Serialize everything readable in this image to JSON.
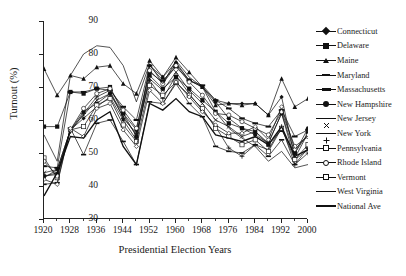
{
  "chart_data": {
    "type": "line",
    "title": "",
    "xlabel": "Presidential Election Years",
    "ylabel": "Turnout (%)",
    "xlim": [
      1920,
      2000
    ],
    "ylim": [
      30,
      90
    ],
    "yticks": [
      30,
      40,
      50,
      60,
      70,
      80,
      90
    ],
    "xticks": [
      1920,
      1928,
      1936,
      1944,
      1952,
      1960,
      1968,
      1976,
      1984,
      1992,
      2000
    ],
    "xtick_minor_step": 4,
    "grid": false,
    "legend_position": "right",
    "x": [
      1920,
      1924,
      1928,
      1932,
      1936,
      1940,
      1944,
      1948,
      1952,
      1956,
      1960,
      1964,
      1968,
      1972,
      1976,
      1980,
      1984,
      1988,
      1992,
      1996,
      2000
    ],
    "series": [
      {
        "name": "Connecticut",
        "marker": "diamond",
        "values": [
          42.5,
          45.0,
          57.0,
          60.5,
          64.0,
          67.0,
          60.0,
          54.0,
          76.5,
          73.0,
          77.5,
          72.0,
          70.0,
          66.0,
          65.0,
          65.0,
          65.0,
          61.5,
          67.0,
          48.5,
          56.0
        ]
      },
      {
        "name": "Delaware",
        "marker": "square",
        "values": [
          58.0,
          58.0,
          68.5,
          68.0,
          69.5,
          70.0,
          62.0,
          55.0,
          73.5,
          69.5,
          73.0,
          69.5,
          66.0,
          62.5,
          59.0,
          57.5,
          56.5,
          52.5,
          57.0,
          50.0,
          56.0
        ]
      },
      {
        "name": "Maine",
        "marker": "triangle",
        "values": [
          75.5,
          67.5,
          73.5,
          72.5,
          76.0,
          76.5,
          71.0,
          68.0,
          78.0,
          73.0,
          79.0,
          74.5,
          70.0,
          64.5,
          65.0,
          64.5,
          65.0,
          61.5,
          72.5,
          64.0,
          66.5
        ]
      },
      {
        "name": "Maryland",
        "marker": "dash",
        "values": [
          40.5,
          41.0,
          57.5,
          49.5,
          59.0,
          60.0,
          53.5,
          46.5,
          65.5,
          65.0,
          71.0,
          65.0,
          61.0,
          52.0,
          50.5,
          50.0,
          52.5,
          49.0,
          54.0,
          46.5,
          51.5
        ]
      },
      {
        "name": "Massachusetts",
        "marker": "bar",
        "values": [
          46.0,
          45.5,
          68.5,
          68.5,
          69.5,
          69.0,
          64.0,
          60.0,
          76.5,
          72.0,
          76.0,
          72.0,
          70.5,
          66.0,
          63.5,
          60.5,
          59.0,
          58.0,
          63.0,
          55.0,
          57.0
        ]
      },
      {
        "name": "New Hampshire",
        "marker": "circle",
        "values": [
          43.0,
          43.5,
          57.0,
          62.5,
          65.0,
          68.0,
          62.0,
          57.0,
          74.5,
          71.5,
          77.0,
          72.0,
          70.0,
          65.5,
          60.5,
          57.5,
          55.5,
          53.0,
          62.0,
          50.0,
          57.5
        ]
      },
      {
        "name": "New Jersey",
        "marker": "x",
        "values": [
          44.0,
          45.0,
          57.0,
          61.5,
          66.0,
          68.0,
          61.0,
          55.5,
          72.5,
          69.0,
          74.5,
          69.0,
          65.0,
          60.0,
          58.0,
          55.0,
          56.5,
          53.0,
          62.0,
          48.0,
          51.0
        ]
      },
      {
        "name": "New York",
        "marker": "plus",
        "values": [
          43.0,
          44.0,
          56.5,
          62.0,
          67.0,
          69.0,
          60.5,
          56.0,
          72.0,
          66.5,
          73.5,
          68.0,
          63.0,
          58.0,
          51.5,
          49.0,
          52.5,
          51.0,
          58.0,
          46.5,
          50.0
        ]
      },
      {
        "name": "Pennsylvania",
        "marker": "open-square",
        "values": [
          48.5,
          42.5,
          57.0,
          58.0,
          64.5,
          66.5,
          58.5,
          53.5,
          70.5,
          67.5,
          71.5,
          67.5,
          63.5,
          57.5,
          55.0,
          52.5,
          54.0,
          50.5,
          57.5,
          48.0,
          52.5
        ]
      },
      {
        "name": "Rhode Island",
        "marker": "open-circle",
        "values": [
          47.5,
          43.0,
          57.0,
          63.5,
          68.0,
          69.5,
          63.0,
          57.5,
          75.0,
          71.0,
          76.5,
          71.5,
          67.5,
          62.0,
          61.5,
          59.5,
          57.5,
          55.5,
          62.5,
          52.0,
          55.0
        ]
      },
      {
        "name": "Vermont",
        "marker": "open-diamond",
        "values": [
          42.0,
          40.5,
          57.5,
          55.0,
          63.5,
          65.0,
          57.0,
          52.0,
          69.0,
          65.0,
          71.5,
          67.0,
          62.5,
          58.5,
          56.0,
          56.0,
          58.0,
          54.0,
          64.0,
          51.0,
          55.5
        ]
      },
      {
        "name": "West Virginia",
        "marker": "none",
        "values": [
          55.5,
          47.5,
          73.5,
          80.0,
          82.5,
          82.0,
          76.5,
          65.5,
          77.0,
          71.0,
          78.0,
          73.0,
          70.0,
          62.5,
          57.5,
          54.5,
          52.0,
          47.5,
          50.5,
          45.5,
          46.5
        ]
      },
      {
        "name": "National Ave",
        "marker": "line-thick",
        "values": [
          37.0,
          44.0,
          55.0,
          54.5,
          60.0,
          62.5,
          52.0,
          46.5,
          65.0,
          63.0,
          66.5,
          62.5,
          61.0,
          55.5,
          54.5,
          53.5,
          55.0,
          52.5,
          58.0,
          49.0,
          51.0
        ]
      }
    ]
  },
  "axes": {
    "y_title": "Turnout (%)",
    "x_title": "Presidential Election Years",
    "y_labels": [
      "90",
      "80",
      "70",
      "60",
      "50",
      "40",
      "30"
    ],
    "x_labels": [
      "1920",
      "1928",
      "1936",
      "1944",
      "1952",
      "1960",
      "1968",
      "1976",
      "1984",
      "1992",
      "2000"
    ]
  },
  "style": {
    "line_color": "#111111",
    "axis_color": "#222222",
    "background": "#ffffff"
  }
}
